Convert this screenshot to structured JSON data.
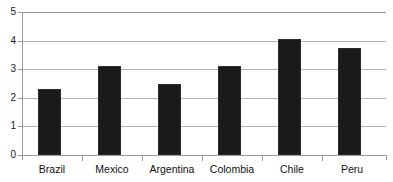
{
  "chart_data": {
    "type": "bar",
    "title": "",
    "subtitle": "",
    "xlabel": "",
    "ylabel": "",
    "categories": [
      "Brazil",
      "Mexico",
      "Argentina",
      "Colombia",
      "Chile",
      "Peru"
    ],
    "values": [
      2.3,
      3.1,
      2.5,
      3.1,
      4.05,
      3.75
    ],
    "ylim": [
      0,
      5
    ],
    "ytick_labels": [
      "0",
      "1",
      "2",
      "3",
      "4",
      "5"
    ],
    "ytick_values": [
      0,
      1,
      2,
      3,
      4,
      5
    ],
    "grid": true,
    "grid_axis": "y",
    "legend": false,
    "legend_position": "none",
    "bar_color": "#1a1a1a",
    "grid_color": "#b5b5b5",
    "axis_color": "#9a9a9a",
    "background_color": "#ffffff"
  }
}
